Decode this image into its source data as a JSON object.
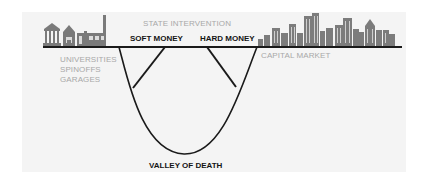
{
  "diagram": {
    "title_label": "STATE INTERVENTION",
    "soft_money": "SOFT MONEY",
    "hard_money": "HARD MONEY",
    "left_side": [
      "UNIVERSITIES",
      "SPINOFFS",
      "GARAGES"
    ],
    "right_side": "CAPITAL MARKET",
    "valley": "VALLEY OF DEATH",
    "icons": {
      "left": "university-factory-icon",
      "right": "city-skyline-icon"
    },
    "colors": {
      "line": "#1a1a1a",
      "gray_text": "#a8a8a8",
      "building": "#777777",
      "panel": "#f4f4f4"
    }
  }
}
